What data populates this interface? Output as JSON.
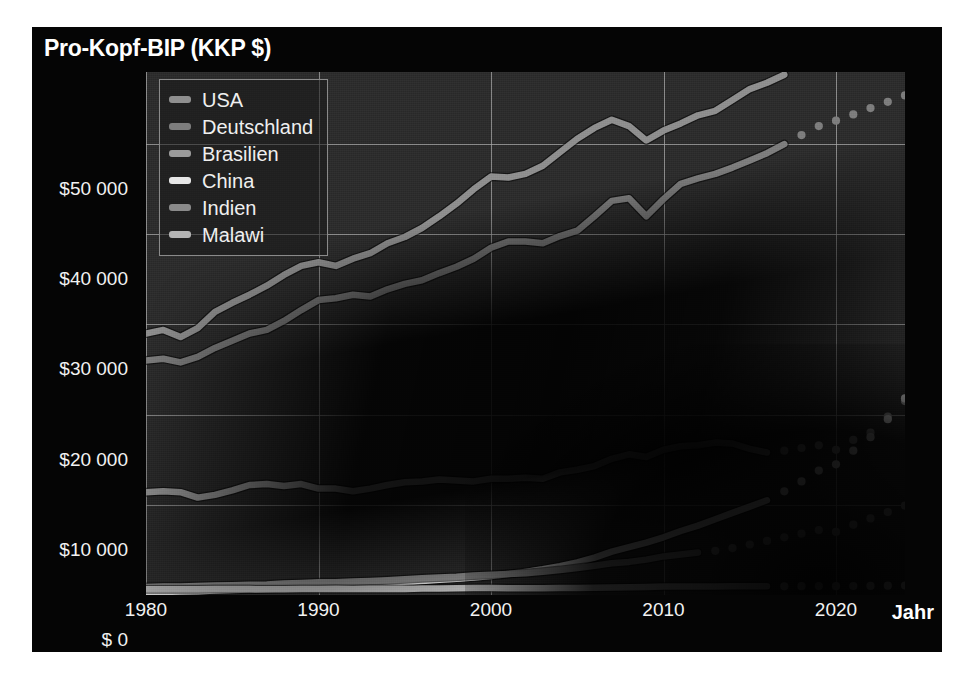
{
  "title": "Pro-Kopf-BIP (KKP $)",
  "axes": {
    "x_title": "Jahr",
    "x_ticks": [
      "1980",
      "1990",
      "2000",
      "2010",
      "2020"
    ],
    "y_ticks": [
      "$50 000",
      "$40 000",
      "$30 000",
      "$20 000",
      "$10 000",
      "$ 0"
    ]
  },
  "legend": {
    "items": [
      {
        "label": "USA",
        "color": "#8f8f8f"
      },
      {
        "label": "Deutschland",
        "color": "#7d7d7d"
      },
      {
        "label": "Brasilien",
        "color": "#9a9a9a"
      },
      {
        "label": "China",
        "color": "#e6e6e6"
      },
      {
        "label": "Indien",
        "color": "#8a8a8a"
      },
      {
        "label": "Malawi",
        "color": "#b4b4b4"
      }
    ]
  },
  "chart_data": {
    "type": "line",
    "title": "Pro-Kopf-BIP (KKP $)",
    "xlabel": "Jahr",
    "ylabel": "Pro-Kopf-BIP (KKP $)",
    "xlim": [
      1980,
      2024
    ],
    "ylim": [
      0,
      58000
    ],
    "grid": true,
    "legend_position": "top-left",
    "note": "Durchgezogene Linien = Ist-Werte, gepunktete Linien = Prognose",
    "x": [
      1980,
      1981,
      1982,
      1983,
      1984,
      1985,
      1986,
      1987,
      1988,
      1989,
      1990,
      1991,
      1992,
      1993,
      1994,
      1995,
      1996,
      1997,
      1998,
      1999,
      2000,
      2001,
      2002,
      2003,
      2004,
      2005,
      2006,
      2007,
      2008,
      2009,
      2010,
      2011,
      2012,
      2013,
      2014,
      2015,
      2016,
      2017,
      2018,
      2019,
      2020,
      2021,
      2022,
      2023,
      2024
    ],
    "series": [
      {
        "name": "USA",
        "color": "#8f8f8f",
        "solid_until": 2017,
        "values": [
          29000,
          29400,
          28600,
          29600,
          31400,
          32400,
          33300,
          34300,
          35500,
          36500,
          36900,
          36500,
          37300,
          37900,
          39000,
          39700,
          40700,
          42000,
          43400,
          45000,
          46400,
          46300,
          46700,
          47600,
          49100,
          50600,
          51800,
          52700,
          52000,
          50400,
          51500,
          52300,
          53200,
          53700,
          54900,
          56100,
          56800,
          57700,
          58900,
          60100,
          61000,
          62000,
          63000,
          64000,
          65000
        ]
      },
      {
        "name": "Deutschland",
        "color": "#7d7d7d",
        "solid_until": 2017,
        "values": [
          26000,
          26200,
          25800,
          26400,
          27400,
          28200,
          29000,
          29400,
          30400,
          31600,
          32700,
          32900,
          33300,
          33100,
          33900,
          34500,
          34900,
          35700,
          36400,
          37300,
          38500,
          39200,
          39200,
          39000,
          39800,
          40400,
          42000,
          43700,
          44000,
          42000,
          43900,
          45600,
          46200,
          46700,
          47400,
          48200,
          49000,
          50000,
          51000,
          52000,
          52600,
          53300,
          54000,
          54700,
          55400
        ]
      },
      {
        "name": "Brasilien",
        "color": "#9a9a9a",
        "solid_until": 2016,
        "values": [
          11400,
          11500,
          11400,
          10800,
          11100,
          11600,
          12200,
          12300,
          12100,
          12300,
          11800,
          11800,
          11500,
          11800,
          12200,
          12500,
          12600,
          12800,
          12700,
          12600,
          12900,
          12900,
          13000,
          12900,
          13600,
          13900,
          14300,
          15100,
          15600,
          15300,
          16100,
          16500,
          16600,
          16900,
          16800,
          16200,
          15800,
          16000,
          16300,
          16600,
          16100,
          17200,
          18000,
          19800,
          21500
        ]
      },
      {
        "name": "China",
        "color": "#e6e6e6",
        "solid_until": 2016,
        "values": [
          310,
          340,
          380,
          420,
          490,
          560,
          600,
          660,
          730,
          760,
          790,
          870,
          980,
          1100,
          1250,
          1400,
          1540,
          1690,
          1810,
          1950,
          2120,
          2320,
          2560,
          2850,
          3200,
          3620,
          4150,
          4800,
          5300,
          5800,
          6400,
          7100,
          7700,
          8400,
          9100,
          9800,
          10500,
          11500,
          12600,
          13800,
          14500,
          16000,
          17500,
          19500,
          21800
        ]
      },
      {
        "name": "Indien",
        "color": "#8a8a8a",
        "solid_until": 2012,
        "values": [
          900,
          930,
          950,
          1000,
          1040,
          1090,
          1130,
          1170,
          1270,
          1340,
          1410,
          1420,
          1490,
          1550,
          1640,
          1740,
          1860,
          1930,
          2030,
          2170,
          2250,
          2340,
          2410,
          2570,
          2760,
          2990,
          3250,
          3530,
          3670,
          3930,
          4280,
          4500,
          4700,
          4900,
          5200,
          5600,
          6000,
          6400,
          6800,
          7200,
          7000,
          7800,
          8500,
          9200,
          9900
        ]
      },
      {
        "name": "Malawi",
        "color": "#b4b4b4",
        "solid_until": 2016,
        "values": [
          640,
          640,
          630,
          640,
          650,
          660,
          650,
          640,
          640,
          650,
          660,
          700,
          660,
          690,
          650,
          680,
          710,
          730,
          740,
          760,
          760,
          740,
          740,
          750,
          770,
          780,
          800,
          830,
          870,
          900,
          930,
          940,
          940,
          950,
          960,
          960,
          960,
          970,
          980,
          990,
          980,
          1000,
          1010,
          1030,
          1050
        ]
      }
    ]
  }
}
